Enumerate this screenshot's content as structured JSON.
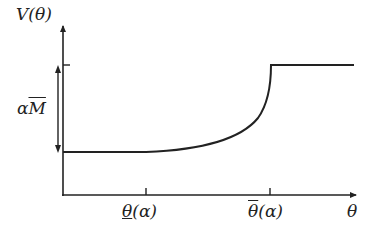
{
  "diagram": {
    "y_axis_label": "V(θ)",
    "x_axis_label": "θ",
    "bracket_label_prefix": "α",
    "bracket_label_overlined": "M",
    "tick_low_label_overlined_underlined": "θ",
    "tick_low_label_suffix": "(α)",
    "tick_high_label_overlined": "θ",
    "tick_high_label_suffix": "(α)"
  },
  "colors": {
    "stroke": "#222222",
    "background": "#ffffff"
  }
}
